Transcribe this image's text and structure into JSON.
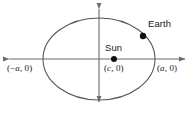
{
  "figure": {
    "type": "geometry-diagram",
    "colors": {
      "stroke": "#555555",
      "axis": "#6b6b6b",
      "dot": "#111111",
      "text": "#1a1a1a",
      "background": "#ffffff"
    }
  },
  "axes": {
    "x_axis_name": "x-axis",
    "y_axis_name": "y-axis",
    "origin": {
      "x": 99,
      "y": 59
    },
    "x_span": {
      "from": 3,
      "to": 190
    },
    "y_span": {
      "from": 3,
      "to": 108
    },
    "arrowheads": [
      "left",
      "right",
      "up",
      "down"
    ]
  },
  "ellipse": {
    "center": {
      "x": 99,
      "y": 59
    },
    "semi_major_axis_px": 56,
    "semi_minor_axis_px": 41
  },
  "points": [
    {
      "id": "vertex-left",
      "label_parts": {
        "open": "(",
        "minus": "−",
        "var": "a",
        "rest": ", 0)"
      },
      "label_text": "(−a, 0)",
      "marker": false,
      "x": 43,
      "y": 59
    },
    {
      "id": "vertex-right",
      "label_parts": {
        "open": "(",
        "minus": "",
        "var": "a",
        "rest": ", 0)"
      },
      "label_text": "(a, 0)",
      "marker": false,
      "x": 155,
      "y": 59
    },
    {
      "id": "focus-sun",
      "label_parts": {
        "open": "(",
        "minus": "",
        "var": "c",
        "rest": ", 0)"
      },
      "label_text": "(c, 0)",
      "body_label": "Sun",
      "marker": true,
      "x": 114,
      "y": 59,
      "radius": 3
    },
    {
      "id": "earth",
      "body_label": "Earth",
      "marker": true,
      "x": 143,
      "y": 36,
      "radius": 3.2
    }
  ],
  "labels": {
    "sun": "Sun",
    "earth": "Earth",
    "vertex_left": "(−a, 0)",
    "vertex_right": "(a, 0)",
    "focus": "(c, 0)"
  }
}
